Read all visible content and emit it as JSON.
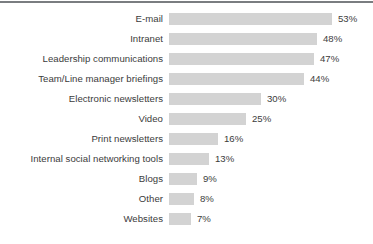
{
  "chart_data": {
    "type": "bar",
    "orientation": "horizontal",
    "title": "",
    "subtitle": "",
    "xlabel": "",
    "ylabel": "",
    "xlim": [
      0,
      60
    ],
    "grid": false,
    "legend": "none",
    "value_suffix": "%",
    "categories": [
      "E-mail",
      "Intranet",
      "Leadership communications",
      "Team/Line manager briefings",
      "Electronic newsletters",
      "Video",
      "Print newsletters",
      "Internal social networking tools",
      "Blogs",
      "Other",
      "Websites"
    ],
    "values": [
      53,
      48,
      47,
      44,
      30,
      25,
      16,
      13,
      9,
      8,
      7
    ],
    "value_labels": [
      "53%",
      "48%",
      "47%",
      "44%",
      "30%",
      "25%",
      "16%",
      "13%",
      "9%",
      "8%",
      "7%"
    ],
    "colors": {
      "bar_fill": "#d3d3d3",
      "text": "#3b3b3b",
      "top_rule": "#7a7d80",
      "background": "#ffffff"
    }
  }
}
